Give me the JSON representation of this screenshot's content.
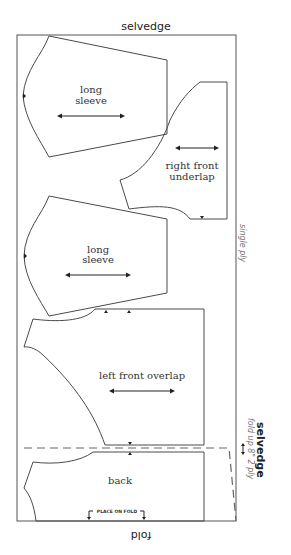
{
  "diagram": {
    "top_label": "selvedge",
    "bottom_label": "fold",
    "right_labels": {
      "single_ply": "single ply",
      "selvedge": "selvedge",
      "fold_note": "fold up 8\" 2 ply"
    },
    "pieces": [
      {
        "name": "long sleeve (top)",
        "label_line1": "long",
        "label_line2": "sleeve",
        "grainline": true
      },
      {
        "name": "right front underlap",
        "label_line1": "right front",
        "label_line2": "underlap",
        "grainline": true
      },
      {
        "name": "long sleeve (middle)",
        "label_line1": "long",
        "label_line2": "sleeve",
        "grainline": true
      },
      {
        "name": "left front overlap",
        "label_line1": "left front overlap",
        "grainline": true
      },
      {
        "name": "back",
        "label_line1": "back",
        "place_on_fold": "PLACE ON FOLD"
      }
    ],
    "colors": {
      "line": "#4a4a4a",
      "text": "#333333",
      "note_text": "#777777",
      "background": "#ffffff"
    }
  }
}
